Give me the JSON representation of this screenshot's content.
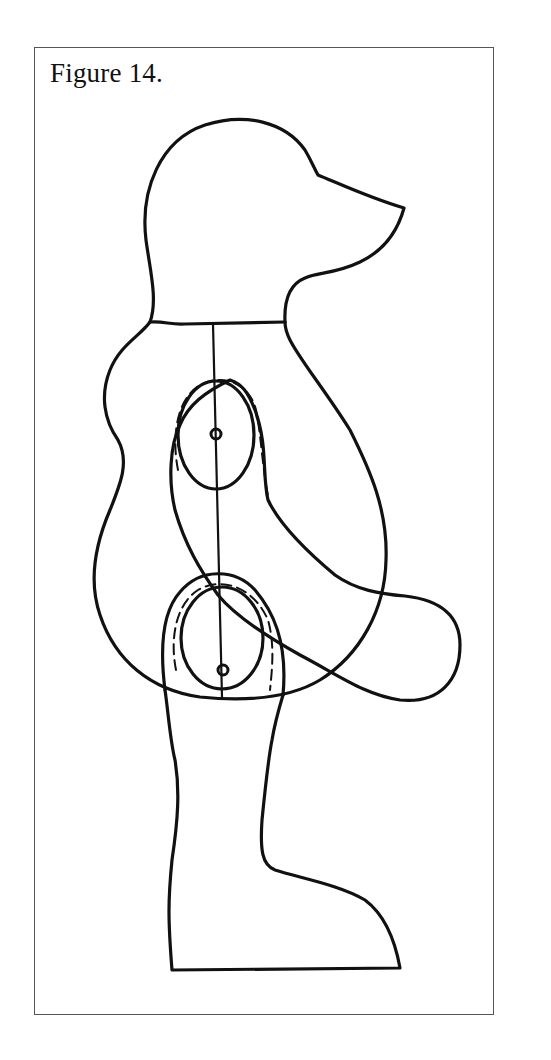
{
  "figure": {
    "caption": "Figure 14.",
    "colors": {
      "ink": "#111111",
      "frame": "#555555",
      "background": "#ffffff"
    },
    "parts": [
      {
        "id": "head",
        "label": "head"
      },
      {
        "id": "body",
        "label": "body"
      },
      {
        "id": "wing",
        "label": "wing"
      },
      {
        "id": "upper-pivot",
        "label": "upper pivot circle"
      },
      {
        "id": "lower-pivot",
        "label": "lower pivot circle"
      },
      {
        "id": "leg",
        "label": "leg and foot"
      },
      {
        "id": "axis-line",
        "label": "vertical axis line"
      }
    ]
  }
}
